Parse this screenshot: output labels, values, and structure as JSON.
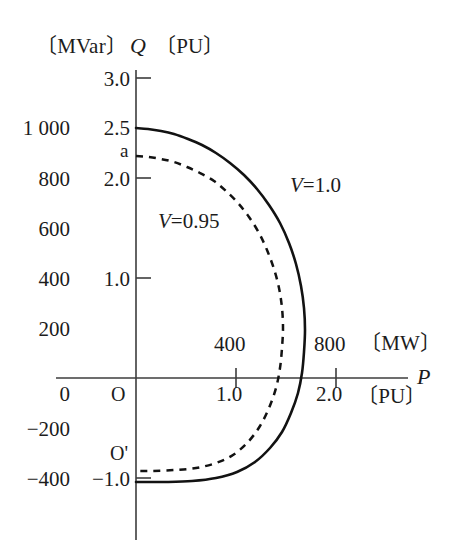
{
  "chart_data": {
    "type": "line",
    "title": "",
    "subtitle": "",
    "xlabel_symbol": "P",
    "ylabel_symbol": "Q",
    "x_units": [
      "[MW]",
      "[PU]"
    ],
    "y_units": [
      "[MVar]",
      "[PU]"
    ],
    "x_axis": {
      "pu_ticks": [
        "1.0",
        "2.0"
      ],
      "pu_values": [
        1.0,
        2.0
      ],
      "mw_ticks": [
        "400",
        "800"
      ],
      "mw_values": [
        400,
        800
      ],
      "pu_to_mw": 400,
      "range_pu": [
        0,
        2.55
      ]
    },
    "y_axis": {
      "pu_ticks": [
        "3.0",
        "2.5",
        "2.0",
        "1.0",
        "-1.0"
      ],
      "pu_values": [
        3.0,
        2.5,
        2.0,
        1.0,
        -1.0
      ],
      "mvar_ticks": [
        "1 000",
        "800",
        "600",
        "400",
        "200",
        "0",
        "-200",
        "-400"
      ],
      "mvar_values": [
        1000,
        800,
        600,
        400,
        200,
        0,
        -200,
        -400
      ],
      "pu_to_mvar": 400,
      "range_pu": [
        -1.6,
        3.1
      ]
    },
    "origin_labels": {
      "mvar_zero": "0",
      "pu_origin": "O",
      "pu_lower": "O'"
    },
    "annotations": [
      {
        "name": "point-a",
        "text": "a",
        "q_pu": 2.2,
        "p_pu": 0.0
      }
    ],
    "grid": false,
    "legend_position": "inline",
    "series": [
      {
        "name": "V=1.0",
        "label": "V=1.0",
        "style": "solid",
        "color": "#121212",
        "points_pu": [
          [
            0.0,
            2.5
          ],
          [
            0.12,
            2.49
          ],
          [
            0.25,
            2.47
          ],
          [
            0.38,
            2.44
          ],
          [
            0.52,
            2.39
          ],
          [
            0.66,
            2.33
          ],
          [
            0.8,
            2.25
          ],
          [
            0.94,
            2.15
          ],
          [
            1.08,
            2.03
          ],
          [
            1.21,
            1.89
          ],
          [
            1.33,
            1.73
          ],
          [
            1.44,
            1.55
          ],
          [
            1.53,
            1.35
          ],
          [
            1.6,
            1.14
          ],
          [
            1.65,
            0.92
          ],
          [
            1.68,
            0.7
          ],
          [
            1.69,
            0.48
          ],
          [
            1.68,
            0.26
          ],
          [
            1.66,
            0.05
          ],
          [
            1.62,
            -0.15
          ],
          [
            1.55,
            -0.35
          ],
          [
            1.46,
            -0.54
          ],
          [
            1.34,
            -0.7
          ],
          [
            1.19,
            -0.84
          ],
          [
            1.01,
            -0.94
          ],
          [
            0.8,
            -1.0
          ],
          [
            0.56,
            -1.03
          ],
          [
            0.3,
            -1.04
          ],
          [
            0.1,
            -1.04
          ],
          [
            0.0,
            -1.04
          ]
        ]
      },
      {
        "name": "V=0.95",
        "label": "V=0.95",
        "style": "dashed",
        "color": "#121212",
        "points_pu": [
          [
            0.0,
            2.22
          ],
          [
            0.12,
            2.21
          ],
          [
            0.25,
            2.19
          ],
          [
            0.38,
            2.16
          ],
          [
            0.51,
            2.11
          ],
          [
            0.64,
            2.05
          ],
          [
            0.78,
            1.97
          ],
          [
            0.9,
            1.87
          ],
          [
            1.02,
            1.75
          ],
          [
            1.13,
            1.61
          ],
          [
            1.23,
            1.45
          ],
          [
            1.31,
            1.28
          ],
          [
            1.38,
            1.09
          ],
          [
            1.43,
            0.9
          ],
          [
            1.46,
            0.7
          ],
          [
            1.47,
            0.5
          ],
          [
            1.46,
            0.3
          ],
          [
            1.44,
            0.1
          ],
          [
            1.4,
            -0.1
          ],
          [
            1.33,
            -0.3
          ],
          [
            1.24,
            -0.48
          ],
          [
            1.12,
            -0.64
          ],
          [
            0.97,
            -0.77
          ],
          [
            0.8,
            -0.85
          ],
          [
            0.6,
            -0.9
          ],
          [
            0.38,
            -0.92
          ],
          [
            0.16,
            -0.93
          ],
          [
            0.0,
            -0.93
          ]
        ]
      }
    ]
  },
  "labels": {
    "y_unit_mvar": "〔MVar〕",
    "y_symbol": "Q",
    "y_unit_pu": "〔PU〕",
    "x_symbol": "P",
    "x_unit_mw": "〔MW〕",
    "x_unit_pu": "〔PU〕",
    "tick_q_30": "3.0",
    "tick_q_25": "2.5",
    "tick_q_20": "2.0",
    "tick_q_10": "1.0",
    "tick_q_m10": "−1.0",
    "tick_mvar_1000": "1 000",
    "tick_mvar_800": "800",
    "tick_mvar_600": "600",
    "tick_mvar_400": "400",
    "tick_mvar_200": "200",
    "tick_mvar_0": "0",
    "tick_mvar_m200": "−200",
    "tick_mvar_m400": "−400",
    "tick_p_10": "1.0",
    "tick_p_20": "2.0",
    "tick_mw_400": "400",
    "tick_mw_800": "800",
    "origin_O": "O",
    "origin_Oprime": "O'",
    "point_a": "a",
    "series_v100": "V=1.0",
    "series_v095": "V=0.95"
  },
  "colors": {
    "curve": "#121212",
    "axis": "#3d3d3d",
    "text": "#1c1c1c",
    "background": "#ffffff"
  }
}
